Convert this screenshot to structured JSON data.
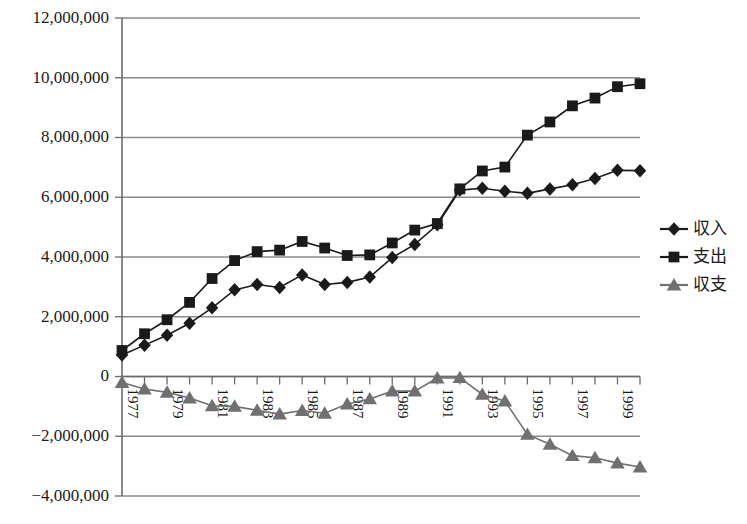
{
  "chart_data": {
    "type": "line",
    "title": "",
    "xlabel": "",
    "ylabel": "",
    "grid": true,
    "legend_position": "right",
    "ylim": [
      -4000000,
      12000000
    ],
    "ytick_values": [
      12000000,
      10000000,
      8000000,
      6000000,
      4000000,
      2000000,
      0,
      -2000000,
      -4000000
    ],
    "ytick_labels": [
      "12,000,000",
      "10,000,000",
      "8,000,000",
      "6,000,000",
      "4,000,000",
      "2,000,000",
      "0",
      "−2,000,000",
      "−4,000,000"
    ],
    "categories": [
      1977,
      1978,
      1979,
      1980,
      1981,
      1982,
      1983,
      1984,
      1985,
      1986,
      1987,
      1988,
      1989,
      1990,
      1991,
      1992,
      1993,
      1994,
      1995,
      1996,
      1997,
      1998,
      1999,
      2000
    ],
    "xtick_labels": [
      "1977",
      "",
      "1979",
      "",
      "1981",
      "",
      "1983",
      "",
      "1985",
      "",
      "1987",
      "",
      "1989",
      "",
      "1991",
      "",
      "1993",
      "",
      "1995",
      "",
      "1997",
      "",
      "1999",
      ""
    ],
    "series": [
      {
        "name": "収入",
        "marker": "diamond",
        "color": "#1a1a1a",
        "values": [
          720000,
          1050000,
          1380000,
          1780000,
          2300000,
          2900000,
          3080000,
          2980000,
          3400000,
          3080000,
          3150000,
          3330000,
          3980000,
          4420000,
          5080000,
          6240000,
          6300000,
          6200000,
          6130000,
          6280000,
          6420000,
          6630000,
          6900000,
          6890000
        ]
      },
      {
        "name": "支出",
        "marker": "square",
        "color": "#1a1a1a",
        "values": [
          870000,
          1430000,
          1900000,
          2480000,
          3280000,
          3880000,
          4180000,
          4230000,
          4520000,
          4300000,
          4050000,
          4070000,
          4470000,
          4900000,
          5120000,
          6280000,
          6880000,
          7010000,
          8080000,
          8520000,
          9060000,
          9320000,
          9700000,
          9800000
        ]
      },
      {
        "name": "収支",
        "marker": "triangle",
        "color": "#707070",
        "values": [
          -200000,
          -420000,
          -530000,
          -720000,
          -980000,
          -1000000,
          -1130000,
          -1260000,
          -1140000,
          -1230000,
          -920000,
          -750000,
          -490000,
          -490000,
          -50000,
          -40000,
          -600000,
          -820000,
          -1940000,
          -2270000,
          -2650000,
          -2720000,
          -2900000,
          -3030000
        ]
      }
    ]
  },
  "legend": {
    "items": [
      {
        "label": "収入",
        "marker": "diamond",
        "color": "#1a1a1a"
      },
      {
        "label": "支出",
        "marker": "square",
        "color": "#1a1a1a"
      },
      {
        "label": "収支",
        "marker": "triangle",
        "color": "#707070"
      }
    ]
  },
  "axes": {
    "axis_color": "#6b6b6b",
    "grid_color": "#8a8a8a",
    "background": "#ffffff"
  }
}
